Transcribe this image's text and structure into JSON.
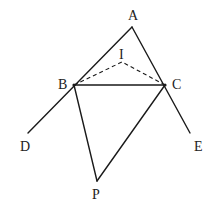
{
  "diagram": {
    "type": "geometry",
    "points": {
      "A": {
        "label": "A",
        "x": 132,
        "y": 27
      },
      "B": {
        "label": "B",
        "x": 74,
        "y": 85
      },
      "C": {
        "label": "C",
        "x": 165,
        "y": 85
      },
      "I": {
        "label": "I",
        "x": 122,
        "y": 62
      },
      "D": {
        "label": "D",
        "x": 28,
        "y": 133
      },
      "E": {
        "label": "E",
        "x": 190,
        "y": 133
      },
      "P": {
        "label": "P",
        "x": 97,
        "y": 181
      }
    },
    "labels": {
      "A": "A",
      "B": "B",
      "C": "C",
      "I": "I",
      "D": "D",
      "E": "E",
      "P": "P"
    },
    "segments": [
      {
        "from": "A",
        "to": "D",
        "style": "solid"
      },
      {
        "from": "A",
        "to": "E",
        "style": "solid"
      },
      {
        "from": "B",
        "to": "C",
        "style": "solid"
      },
      {
        "from": "B",
        "to": "P",
        "style": "solid"
      },
      {
        "from": "C",
        "to": "P",
        "style": "solid"
      },
      {
        "from": "B",
        "to": "I",
        "style": "dashed"
      },
      {
        "from": "C",
        "to": "I",
        "style": "dashed"
      }
    ],
    "colors": {
      "stroke": "#1a1a1a",
      "text": "#222222",
      "background": "#ffffff"
    }
  }
}
